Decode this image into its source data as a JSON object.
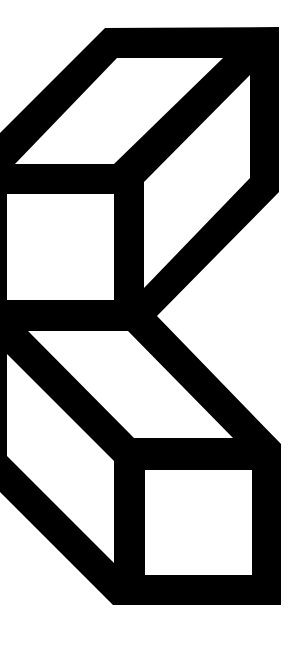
{
  "image": {
    "description": "Two stacked outlined cubes in isometric view, black on white",
    "width": 302,
    "height": 647,
    "colors": {
      "background": "#ffffff",
      "ink": "#000000"
    }
  },
  "shapes": {
    "silhouette": "0,133 105,28 279,27 279,192 157,316 281,444 281,605 113,605 0,492",
    "holes": [
      {
        "name": "upper-cube-top-face",
        "points": "15,164 117,58 223,58 114,164"
      },
      {
        "name": "upper-cube-front-face",
        "points": "7,194 114,194 114,300 7,300"
      },
      {
        "name": "upper-cube-right-face",
        "points": "144,182 250,75 250,178 144,288"
      },
      {
        "name": "lower-cube-top-face",
        "points": "28,331 128,331 233,438 134,438"
      },
      {
        "name": "lower-cube-left-face",
        "points": "7,354 114,461 114,563 7,456"
      },
      {
        "name": "lower-cube-front-face",
        "points": "145,470 252,470 252,575 145,575"
      }
    ]
  }
}
